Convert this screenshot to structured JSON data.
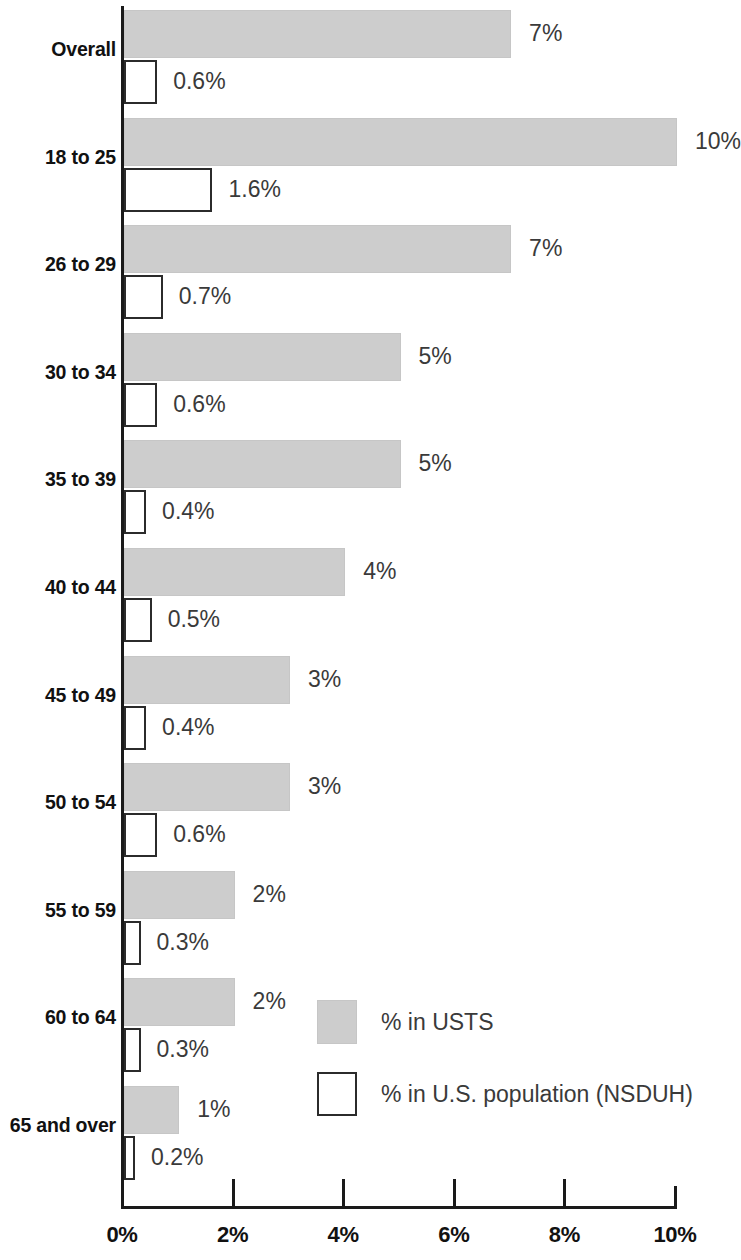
{
  "chart_data": {
    "type": "bar",
    "orientation": "horizontal",
    "title": "",
    "subtitle": "",
    "xlabel": "",
    "ylabel": "",
    "xlim": [
      0,
      10
    ],
    "grid": false,
    "legend_position": "inside-lower-right",
    "categories": [
      "Overall",
      "18 to 25",
      "26 to 29",
      "30 to 34",
      "35 to 39",
      "40 to 44",
      "45 to 49",
      "50 to 54",
      "55 to 59",
      "60 to 64",
      "65 and over"
    ],
    "tick_labels": [
      "0%",
      "2%",
      "4%",
      "6%",
      "8%",
      "10%"
    ],
    "tick_values": [
      0,
      2,
      4,
      6,
      8,
      10
    ],
    "series": [
      {
        "name": "% in USTS",
        "color": "#cdcdcd",
        "values": [
          7,
          10,
          7,
          5,
          5,
          4,
          3,
          3,
          2,
          2,
          1
        ],
        "labels": [
          "7%",
          "10%",
          "7%",
          "5%",
          "5%",
          "4%",
          "3%",
          "3%",
          "2%",
          "2%",
          "1%"
        ]
      },
      {
        "name": "% in U.S. population (NSDUH)",
        "color": "#ffffff",
        "values": [
          0.6,
          1.6,
          0.7,
          0.6,
          0.4,
          0.5,
          0.4,
          0.6,
          0.3,
          0.3,
          0.2
        ],
        "labels": [
          "0.6%",
          "1.6%",
          "0.7%",
          "0.6%",
          "0.4%",
          "0.5%",
          "0.4%",
          "0.6%",
          "0.3%",
          "0.3%",
          "0.2%"
        ]
      }
    ]
  },
  "legend": {
    "items": [
      {
        "label": "% in USTS",
        "swatch": "filled-gray"
      },
      {
        "label": "% in U.S. population (NSDUH)",
        "swatch": "outlined-white"
      }
    ]
  },
  "colors": {
    "bar_usts_fill": "#cdcdcd",
    "bar_nsduh_fill": "#ffffff",
    "bar_nsduh_stroke": "#2b2b2b",
    "axis": "#1a1a1a",
    "label_text": "#111111",
    "value_text": "#3a3a3a"
  }
}
